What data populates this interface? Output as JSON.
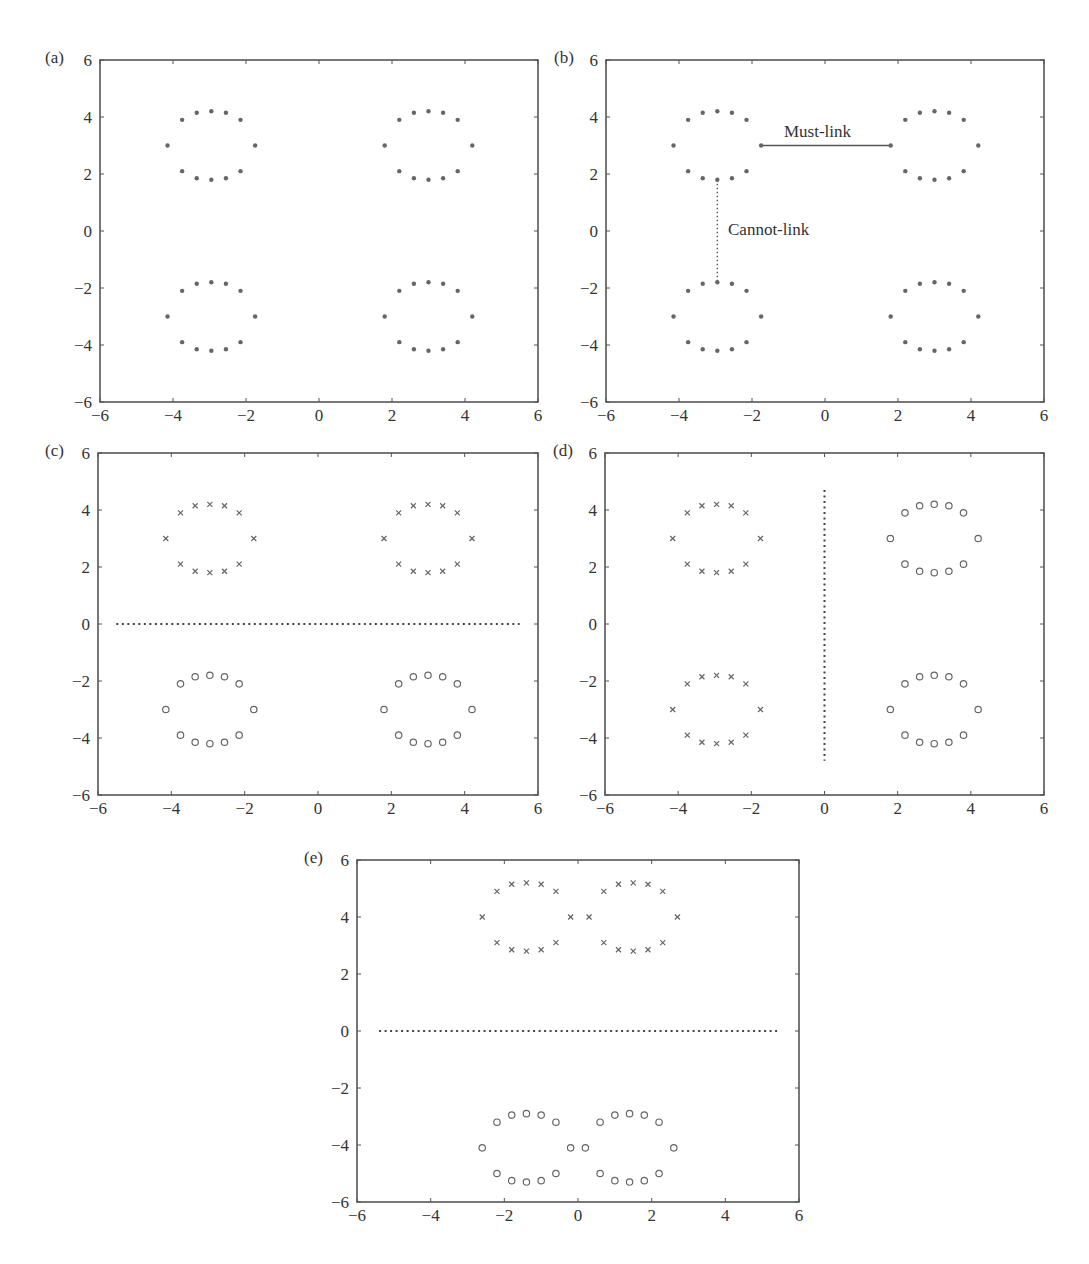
{
  "figure": {
    "panel_labels": [
      "(a)",
      "(b)",
      "(c)",
      "(d)",
      "(e)"
    ],
    "annotations": {
      "must_link": "Must-link",
      "cannot_link": "Cannot-link"
    },
    "colors": {
      "axis": "#555555",
      "marker": "#666666",
      "text": "#333333"
    }
  },
  "chart_data": [
    {
      "id": "a",
      "type": "scatter",
      "title": "(a)",
      "xlim": [
        -6,
        6
      ],
      "ylim": [
        -6,
        6
      ],
      "xticks": [
        -6,
        -4,
        -2,
        0,
        2,
        4,
        6
      ],
      "yticks": [
        -6,
        -4,
        -2,
        0,
        2,
        4,
        6
      ],
      "grid": false,
      "series": [
        {
          "name": "points",
          "marker": "dot",
          "rings": [
            [
              -2.95,
              3
            ],
            [
              3.0,
              3
            ],
            [
              -2.95,
              -3
            ],
            [
              3.0,
              -3
            ]
          ]
        }
      ]
    },
    {
      "id": "b",
      "type": "scatter",
      "title": "(b)",
      "xlim": [
        -6,
        6
      ],
      "ylim": [
        -6,
        6
      ],
      "xticks": [
        -6,
        -4,
        -2,
        0,
        2,
        4,
        6
      ],
      "yticks": [
        -6,
        -4,
        -2,
        0,
        2,
        4,
        6
      ],
      "grid": false,
      "series": [
        {
          "name": "points",
          "marker": "dot",
          "rings": [
            [
              -2.95,
              3
            ],
            [
              3.0,
              3
            ],
            [
              -2.95,
              -3
            ],
            [
              3.0,
              -3
            ]
          ]
        }
      ],
      "constraints": [
        {
          "type": "must-link",
          "label": "Must-link",
          "from": [
            -1.75,
            3
          ],
          "to": [
            1.8,
            3
          ],
          "style": "solid"
        },
        {
          "type": "cannot-link",
          "label": "Cannot-link",
          "from": [
            -2.95,
            1.8
          ],
          "to": [
            -2.95,
            -1.8
          ],
          "style": "dotted"
        }
      ]
    },
    {
      "id": "c",
      "type": "scatter",
      "title": "(c)",
      "xlim": [
        -6,
        6
      ],
      "ylim": [
        -6,
        6
      ],
      "xticks": [
        -6,
        -4,
        -2,
        0,
        2,
        4,
        6
      ],
      "yticks": [
        -6,
        -4,
        -2,
        0,
        2,
        4,
        6
      ],
      "grid": false,
      "series": [
        {
          "name": "cluster 1",
          "marker": "x",
          "rings": [
            [
              -2.95,
              3
            ],
            [
              3.0,
              3
            ]
          ]
        },
        {
          "name": "cluster 2",
          "marker": "o",
          "rings": [
            [
              -2.95,
              -3
            ],
            [
              3.0,
              -3
            ]
          ]
        }
      ],
      "boundary": {
        "from": [
          -5.5,
          0
        ],
        "to": [
          5.5,
          0
        ],
        "style": "dotted"
      }
    },
    {
      "id": "d",
      "type": "scatter",
      "title": "(d)",
      "xlim": [
        -6,
        6
      ],
      "ylim": [
        -6,
        6
      ],
      "xticks": [
        -6,
        -4,
        -2,
        0,
        2,
        4,
        6
      ],
      "yticks": [
        -6,
        -4,
        -2,
        0,
        2,
        4,
        6
      ],
      "grid": false,
      "series": [
        {
          "name": "cluster 1",
          "marker": "x",
          "rings": [
            [
              -2.95,
              3
            ],
            [
              -2.95,
              -3
            ]
          ]
        },
        {
          "name": "cluster 2",
          "marker": "o",
          "rings": [
            [
              3.0,
              3
            ],
            [
              3.0,
              -3
            ]
          ]
        }
      ],
      "boundary": {
        "from": [
          0,
          4.7
        ],
        "to": [
          0,
          -4.8
        ],
        "style": "dotted"
      }
    },
    {
      "id": "e",
      "type": "scatter",
      "title": "(e)",
      "xlim": [
        -6,
        6
      ],
      "ylim": [
        -6,
        6
      ],
      "xticks": [
        -6,
        -4,
        -2,
        0,
        2,
        4,
        6
      ],
      "yticks": [
        -6,
        -4,
        -2,
        0,
        2,
        4,
        6
      ],
      "grid": false,
      "series": [
        {
          "name": "cluster 1",
          "marker": "x",
          "rings": [
            [
              -1.4,
              4
            ],
            [
              1.5,
              4
            ]
          ]
        },
        {
          "name": "cluster 2",
          "marker": "o",
          "rings": [
            [
              -1.4,
              -4.1
            ],
            [
              1.4,
              -4.1
            ]
          ]
        }
      ],
      "boundary": {
        "from": [
          -5.4,
          0
        ],
        "to": [
          5.5,
          0
        ],
        "style": "dotted"
      }
    }
  ],
  "ring_shape": {
    "dx": [
      -1.2,
      -0.8,
      -0.4,
      0,
      0.4,
      0.8,
      1.2,
      0.8,
      0.4,
      0,
      -0.4,
      -0.8
    ],
    "dy": [
      0,
      0.9,
      1.15,
      1.2,
      1.15,
      0.9,
      0,
      -0.9,
      -1.15,
      -1.2,
      -1.15,
      -0.9
    ]
  }
}
